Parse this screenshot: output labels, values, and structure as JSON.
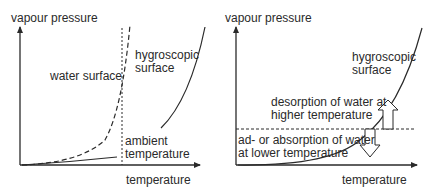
{
  "left_panel": {
    "y_axis_label": "vapour pressure",
    "x_axis_label": "temperature",
    "curve_water_label": "water surface",
    "curve_hygro_label_1": "hygroscopic",
    "curve_hygro_label_2": "surface",
    "ambient_label_1": "ambient",
    "ambient_label_2": "temperature"
  },
  "right_panel": {
    "y_axis_label": "vapour pressure",
    "x_axis_label": "temperature",
    "curve_hygro_label_1": "hygroscopic",
    "curve_hygro_label_2": "surface",
    "desorption_label_1": "desorption of water at",
    "desorption_label_2": "higher temperature",
    "absorption_label_1": "ad- or absorption of water",
    "absorption_label_2": "at lower temperature"
  },
  "colors": {
    "line": "#2a2a2a",
    "background": "#ffffff"
  }
}
